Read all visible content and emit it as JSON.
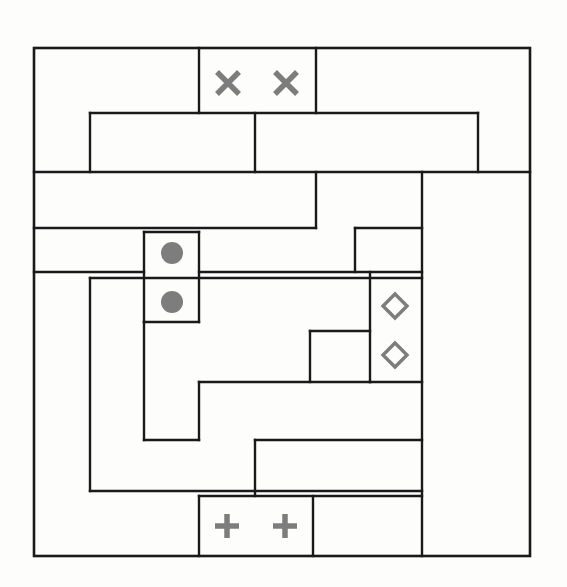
{
  "puzzle": {
    "title": "Shape Partition Puzzle",
    "type": "region-partition-grid",
    "background_color": "#fdfdfc",
    "line_color": "#1a1a1a",
    "marker_color": "#7d7d7d",
    "canvas": {
      "width": 567,
      "height": 587
    },
    "board": {
      "x": 34,
      "y": 48,
      "width": 496,
      "height": 508
    },
    "border_stroke_width": 2.6,
    "inner_stroke_width": 2.4,
    "segments": [
      {
        "name": "seg-01",
        "x1": 199,
        "y1": 48,
        "x2": 199,
        "y2": 113
      },
      {
        "name": "seg-02",
        "x1": 316,
        "y1": 48,
        "x2": 316,
        "y2": 113
      },
      {
        "name": "seg-03",
        "x1": 90,
        "y1": 113,
        "x2": 478,
        "y2": 113
      },
      {
        "name": "seg-04",
        "x1": 90,
        "y1": 113,
        "x2": 90,
        "y2": 172
      },
      {
        "name": "seg-05",
        "x1": 255,
        "y1": 113,
        "x2": 255,
        "y2": 172
      },
      {
        "name": "seg-06",
        "x1": 478,
        "y1": 113,
        "x2": 478,
        "y2": 172
      },
      {
        "name": "seg-07",
        "x1": 34,
        "y1": 172,
        "x2": 530,
        "y2": 172
      },
      {
        "name": "seg-08",
        "x1": 316,
        "y1": 172,
        "x2": 316,
        "y2": 228
      },
      {
        "name": "seg-09",
        "x1": 422,
        "y1": 172,
        "x2": 422,
        "y2": 556
      },
      {
        "name": "seg-10",
        "x1": 34,
        "y1": 228,
        "x2": 316,
        "y2": 228
      },
      {
        "name": "seg-11",
        "x1": 355,
        "y1": 228,
        "x2": 422,
        "y2": 228
      },
      {
        "name": "seg-12",
        "x1": 355,
        "y1": 228,
        "x2": 355,
        "y2": 272
      },
      {
        "name": "seg-13",
        "x1": 144,
        "y1": 232,
        "x2": 144,
        "y2": 322
      },
      {
        "name": "seg-14",
        "x1": 199,
        "y1": 232,
        "x2": 199,
        "y2": 322
      },
      {
        "name": "seg-15",
        "x1": 144,
        "y1": 232,
        "x2": 199,
        "y2": 232
      },
      {
        "name": "seg-16",
        "x1": 34,
        "y1": 272,
        "x2": 144,
        "y2": 272
      },
      {
        "name": "seg-17",
        "x1": 199,
        "y1": 272,
        "x2": 422,
        "y2": 272
      },
      {
        "name": "seg-18",
        "x1": 370,
        "y1": 272,
        "x2": 370,
        "y2": 382
      },
      {
        "name": "seg-19",
        "x1": 90,
        "y1": 278,
        "x2": 422,
        "y2": 278
      },
      {
        "name": "seg-20",
        "x1": 90,
        "y1": 278,
        "x2": 90,
        "y2": 491
      },
      {
        "name": "seg-21",
        "x1": 144,
        "y1": 322,
        "x2": 199,
        "y2": 322
      },
      {
        "name": "seg-22",
        "x1": 144,
        "y1": 322,
        "x2": 144,
        "y2": 440
      },
      {
        "name": "seg-23",
        "x1": 310,
        "y1": 331,
        "x2": 370,
        "y2": 331
      },
      {
        "name": "seg-24",
        "x1": 310,
        "y1": 331,
        "x2": 310,
        "y2": 382
      },
      {
        "name": "seg-25",
        "x1": 199,
        "y1": 382,
        "x2": 370,
        "y2": 382
      },
      {
        "name": "seg-26",
        "x1": 199,
        "y1": 382,
        "x2": 199,
        "y2": 440
      },
      {
        "name": "seg-27",
        "x1": 370,
        "y1": 382,
        "x2": 422,
        "y2": 382
      },
      {
        "name": "seg-28",
        "x1": 144,
        "y1": 440,
        "x2": 199,
        "y2": 440
      },
      {
        "name": "seg-29",
        "x1": 255,
        "y1": 440,
        "x2": 422,
        "y2": 440
      },
      {
        "name": "seg-30",
        "x1": 255,
        "y1": 440,
        "x2": 255,
        "y2": 496
      },
      {
        "name": "seg-31",
        "x1": 90,
        "y1": 491,
        "x2": 422,
        "y2": 491
      },
      {
        "name": "seg-32",
        "x1": 199,
        "y1": 496,
        "x2": 422,
        "y2": 496
      },
      {
        "name": "seg-33",
        "x1": 199,
        "y1": 496,
        "x2": 199,
        "y2": 556
      },
      {
        "name": "seg-34",
        "x1": 313,
        "y1": 496,
        "x2": 313,
        "y2": 556
      }
    ],
    "markers": [
      {
        "name": "marker-cross-1",
        "shape": "cross",
        "cx": 228,
        "cy": 83,
        "size": 22
      },
      {
        "name": "marker-cross-2",
        "shape": "cross",
        "cx": 286,
        "cy": 83,
        "size": 22
      },
      {
        "name": "marker-circle-1",
        "shape": "circle",
        "cx": 172,
        "cy": 253,
        "size": 22
      },
      {
        "name": "marker-circle-2",
        "shape": "circle",
        "cx": 172,
        "cy": 302,
        "size": 22
      },
      {
        "name": "marker-diamond-1",
        "shape": "diamond",
        "cx": 395,
        "cy": 306,
        "size": 24
      },
      {
        "name": "marker-diamond-2",
        "shape": "diamond",
        "cx": 395,
        "cy": 355,
        "size": 24
      },
      {
        "name": "marker-plus-1",
        "shape": "plus",
        "cx": 227,
        "cy": 526,
        "size": 24
      },
      {
        "name": "marker-plus-2",
        "shape": "plus",
        "cx": 285,
        "cy": 526,
        "size": 24
      }
    ],
    "marker_counts": {
      "cross": 2,
      "circle": 2,
      "diamond": 2,
      "plus": 2
    }
  }
}
